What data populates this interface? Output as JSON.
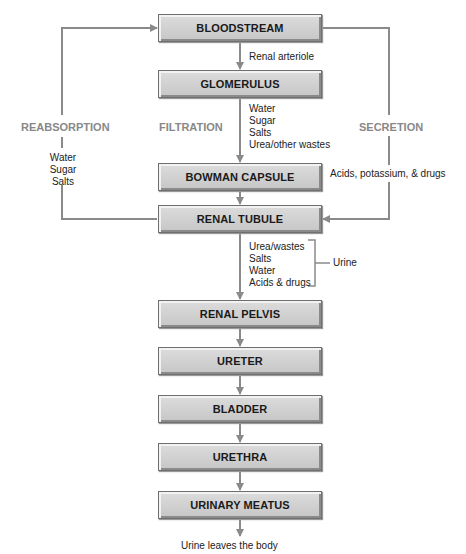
{
  "boxes": [
    {
      "id": "bloodstream",
      "label": "BLOODSTREAM",
      "top": 14
    },
    {
      "id": "glomerulus",
      "label": "GLOMERULUS",
      "top": 70
    },
    {
      "id": "bowman-capsule",
      "label": "BOWMAN CAPSULE",
      "top": 163
    },
    {
      "id": "renal-tubule",
      "label": "RENAL TUBULE",
      "top": 205
    },
    {
      "id": "renal-pelvis",
      "label": "RENAL PELVIS",
      "top": 300
    },
    {
      "id": "ureter",
      "label": "URETER",
      "top": 347
    },
    {
      "id": "bladder",
      "label": "BLADDER",
      "top": 395
    },
    {
      "id": "urethra",
      "label": "URETHRA",
      "top": 443
    },
    {
      "id": "urinary-meatus",
      "label": "URINARY MEATUS",
      "top": 491
    }
  ],
  "labels": {
    "renal_arteriole": "Renal arteriole",
    "reabsorption": "REABSORPTION",
    "filtration": "FILTRATION",
    "secretion": "SECRETION",
    "filtrate": [
      "Water",
      "Sugar",
      "Salts",
      "Urea/other wastes"
    ],
    "reabsorbed": [
      "Water",
      "Sugar",
      "Salts"
    ],
    "secreted": "Acids, potassium, & drugs",
    "urine_contents": [
      "Urea/wastes",
      "Salts",
      "Water",
      "Acids & drugs"
    ],
    "urine": "Urine",
    "exit": "Urine leaves the body"
  },
  "colors": {
    "line": "#8a8a8a",
    "box_fill": "#d2d2d2",
    "caption": "#888888"
  }
}
